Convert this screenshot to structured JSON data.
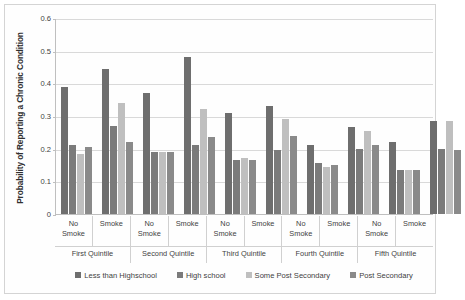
{
  "chart_data": {
    "type": "bar",
    "title": "",
    "xlabel": "",
    "ylabel": "Probability of Reporting a Chronic Condition",
    "ylim": [
      0,
      0.6
    ],
    "ytick_labels": [
      "0",
      "0.1",
      "0.2",
      "0.3",
      "0.4",
      "0.5",
      "0.6"
    ],
    "ytick_values": [
      0,
      0.1,
      0.2,
      0.3,
      0.4,
      0.5,
      0.6
    ],
    "grid": true,
    "legend_position": "bottom",
    "group_labels": [
      "First Quintile",
      "Second Quintile",
      "Third Quintile",
      "Fourth Quintile",
      "Fifth Quintile"
    ],
    "subgroup_labels": [
      "No Smoke",
      "Smoke"
    ],
    "series": [
      {
        "name": "Less than Highschool",
        "color": "#6e6e6e",
        "values": [
          0.39,
          0.445,
          0.37,
          0.48,
          0.31,
          0.33,
          0.21,
          0.265,
          0.22,
          0.285
        ]
      },
      {
        "name": "High school",
        "color": "#7b7b7b",
        "values": [
          0.21,
          0.27,
          0.19,
          0.21,
          0.165,
          0.195,
          0.155,
          0.2,
          0.135,
          0.2
        ]
      },
      {
        "name": "Some Post Secondary",
        "color": "#bfbfbf",
        "values": [
          0.185,
          0.34,
          0.19,
          0.32,
          0.17,
          0.29,
          0.145,
          0.255,
          0.135,
          0.285
        ]
      },
      {
        "name": "Post Secondary",
        "color": "#8a8a8a",
        "values": [
          0.205,
          0.22,
          0.19,
          0.235,
          0.165,
          0.24,
          0.15,
          0.21,
          0.135,
          0.195
        ]
      }
    ],
    "groups": [
      {
        "label": "First Quintile",
        "subgroups": [
          {
            "label_line1": "No",
            "label_line2": "Smoke",
            "bars": [
              0.39,
              0.21,
              0.185,
              0.205
            ]
          },
          {
            "label_line1": "Smoke",
            "label_line2": "",
            "bars": [
              0.445,
              0.27,
              0.34,
              0.22
            ]
          }
        ]
      },
      {
        "label": "Second Quintile",
        "subgroups": [
          {
            "label_line1": "No",
            "label_line2": "Smoke",
            "bars": [
              0.37,
              0.19,
              0.19,
              0.19
            ]
          },
          {
            "label_line1": "Smoke",
            "label_line2": "",
            "bars": [
              0.48,
              0.21,
              0.32,
              0.235
            ]
          }
        ]
      },
      {
        "label": "Third Quintile",
        "subgroups": [
          {
            "label_line1": "No",
            "label_line2": "Smoke",
            "bars": [
              0.31,
              0.165,
              0.17,
              0.165
            ]
          },
          {
            "label_line1": "Smoke",
            "label_line2": "",
            "bars": [
              0.33,
              0.195,
              0.29,
              0.24
            ]
          }
        ]
      },
      {
        "label": "Fourth Quintile",
        "subgroups": [
          {
            "label_line1": "No",
            "label_line2": "Smoke",
            "bars": [
              0.21,
              0.155,
              0.145,
              0.15
            ]
          },
          {
            "label_line1": "Smoke",
            "label_line2": "",
            "bars": [
              0.265,
              0.2,
              0.255,
              0.21
            ]
          }
        ]
      },
      {
        "label": "Fifth Quintile",
        "subgroups": [
          {
            "label_line1": "No",
            "label_line2": "Smoke",
            "bars": [
              0.22,
              0.135,
              0.135,
              0.135
            ]
          },
          {
            "label_line1": "Smoke",
            "label_line2": "",
            "bars": [
              0.285,
              0.2,
              0.285,
              0.195
            ]
          }
        ]
      }
    ]
  }
}
